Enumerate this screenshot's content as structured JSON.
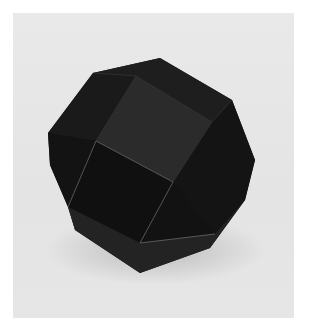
{
  "image": {
    "subject": "Dark paper polyhedron model (rhombicuboctahedron-like) on light gray background",
    "caption": "",
    "colors": {
      "background": "#e6e6e6",
      "border": "#ffffff",
      "face_darkest": "#121212",
      "face_dark": "#1b1b1b",
      "face_mid": "#262626",
      "face_light": "#2f2f2f",
      "edge_highlight": "#8a8a8a"
    }
  }
}
